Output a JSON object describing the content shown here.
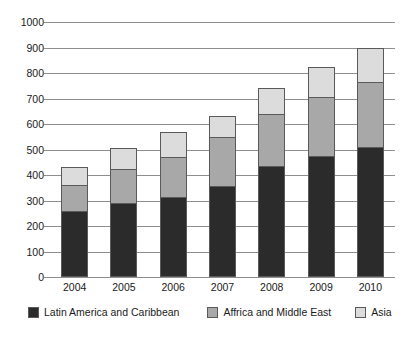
{
  "chart_data": {
    "type": "bar",
    "subtype": "stacked-vertical",
    "title": "",
    "subtitle": "",
    "xlabel": "",
    "ylabel": "",
    "categories": [
      "2004",
      "2005",
      "2006",
      "2007",
      "2008",
      "2009",
      "2010"
    ],
    "series": [
      {
        "name": "Latin America and Caribbean",
        "color": "#2b2b2b",
        "values": [
          258,
          292,
          315,
          358,
          435,
          475,
          510
        ]
      },
      {
        "name": "Affrica and Middle East",
        "color": "#a8a8a8",
        "values": [
          102,
          133,
          155,
          190,
          205,
          230,
          255
        ]
      },
      {
        "name": "Asia",
        "color": "#dcdcdc",
        "values": [
          70,
          80,
          98,
          82,
          103,
          120,
          135
        ]
      }
    ],
    "totals": [
      430,
      505,
      568,
      630,
      743,
      825,
      900
    ],
    "ylim": [
      0,
      1000
    ],
    "ytick_step": 100,
    "yticks": [
      "1000",
      "900",
      "800",
      "700",
      "600",
      "500",
      "400",
      "300",
      "200",
      "100",
      "0"
    ],
    "grid": true,
    "grid_axis": "y",
    "legend_position": "bottom",
    "colors": {
      "latin_america": "#2b2b2b",
      "africa_middle_east": "#a8a8a8",
      "asia": "#dcdcdc",
      "gridline": "#8e8e8e",
      "bar_outline": "#5a5a5a",
      "background": "#ffffff",
      "text": "#1a1a1a"
    }
  },
  "legend": {
    "items": [
      {
        "label": "Latin America and Caribbean",
        "color": "#2b2b2b"
      },
      {
        "label": "Affrica and Middle East",
        "color": "#a8a8a8"
      },
      {
        "label": "Asia",
        "color": "#dcdcdc"
      }
    ]
  }
}
